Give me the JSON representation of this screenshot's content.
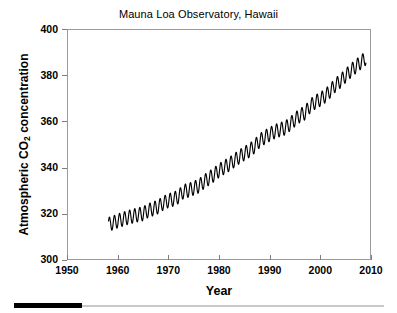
{
  "chart_data": {
    "type": "line",
    "title": "Mauna Loa Observatory, Hawaii",
    "xlabel": "Year",
    "ylabel": "Atmospheric CO2 concentration",
    "ylabel_parts": {
      "pre": "Atmospheric CO",
      "sub": "2",
      "post": " concentration"
    },
    "xlim": [
      1950,
      2010
    ],
    "ylim": [
      300,
      400
    ],
    "xticks": [
      1950,
      1960,
      1970,
      1980,
      1990,
      2000,
      2010
    ],
    "yticks": [
      300,
      320,
      340,
      360,
      380,
      400
    ],
    "grid": false,
    "legend": null,
    "line_color": "#000000",
    "frame_color": "#9a9a9a",
    "series": [
      {
        "name": "Monthly mean CO2 (ppm)",
        "description": "Keeling curve: rising trend with annual seasonal sawtooth of about 6 ppm peak-to-peak",
        "x_start": 1958.2,
        "x_end": 2009.0,
        "seasonal_amplitude_ppm": 3.0,
        "annual_means": [
          {
            "year": 1958,
            "value": 315.3
          },
          {
            "year": 1959,
            "value": 315.98
          },
          {
            "year": 1960,
            "value": 316.91
          },
          {
            "year": 1961,
            "value": 317.64
          },
          {
            "year": 1962,
            "value": 318.45
          },
          {
            "year": 1963,
            "value": 318.99
          },
          {
            "year": 1964,
            "value": 319.62
          },
          {
            "year": 1965,
            "value": 320.04
          },
          {
            "year": 1966,
            "value": 321.38
          },
          {
            "year": 1967,
            "value": 322.16
          },
          {
            "year": 1968,
            "value": 323.04
          },
          {
            "year": 1969,
            "value": 324.62
          },
          {
            "year": 1970,
            "value": 325.68
          },
          {
            "year": 1971,
            "value": 326.32
          },
          {
            "year": 1972,
            "value": 327.45
          },
          {
            "year": 1973,
            "value": 329.68
          },
          {
            "year": 1974,
            "value": 330.18
          },
          {
            "year": 1975,
            "value": 331.11
          },
          {
            "year": 1976,
            "value": 332.04
          },
          {
            "year": 1977,
            "value": 333.83
          },
          {
            "year": 1978,
            "value": 335.4
          },
          {
            "year": 1979,
            "value": 336.84
          },
          {
            "year": 1980,
            "value": 338.75
          },
          {
            "year": 1981,
            "value": 340.11
          },
          {
            "year": 1982,
            "value": 341.45
          },
          {
            "year": 1983,
            "value": 343.05
          },
          {
            "year": 1984,
            "value": 344.65
          },
          {
            "year": 1985,
            "value": 346.12
          },
          {
            "year": 1986,
            "value": 347.42
          },
          {
            "year": 1987,
            "value": 349.19
          },
          {
            "year": 1988,
            "value": 351.57
          },
          {
            "year": 1989,
            "value": 353.12
          },
          {
            "year": 1990,
            "value": 354.39
          },
          {
            "year": 1991,
            "value": 355.61
          },
          {
            "year": 1992,
            "value": 356.45
          },
          {
            "year": 1993,
            "value": 357.1
          },
          {
            "year": 1994,
            "value": 358.83
          },
          {
            "year": 1995,
            "value": 360.82
          },
          {
            "year": 1996,
            "value": 362.61
          },
          {
            "year": 1997,
            "value": 363.73
          },
          {
            "year": 1998,
            "value": 366.7
          },
          {
            "year": 1999,
            "value": 368.38
          },
          {
            "year": 2000,
            "value": 369.55
          },
          {
            "year": 2001,
            "value": 371.14
          },
          {
            "year": 2002,
            "value": 373.28
          },
          {
            "year": 2003,
            "value": 375.8
          },
          {
            "year": 2004,
            "value": 377.52
          },
          {
            "year": 2005,
            "value": 379.8
          },
          {
            "year": 2006,
            "value": 381.9
          },
          {
            "year": 2007,
            "value": 383.79
          },
          {
            "year": 2008,
            "value": 385.6
          },
          {
            "year": 2009,
            "value": 387.43
          }
        ]
      }
    ]
  },
  "bottom_bar": {
    "thumb_color": "#000000",
    "track_color": "#c9c9c9"
  }
}
